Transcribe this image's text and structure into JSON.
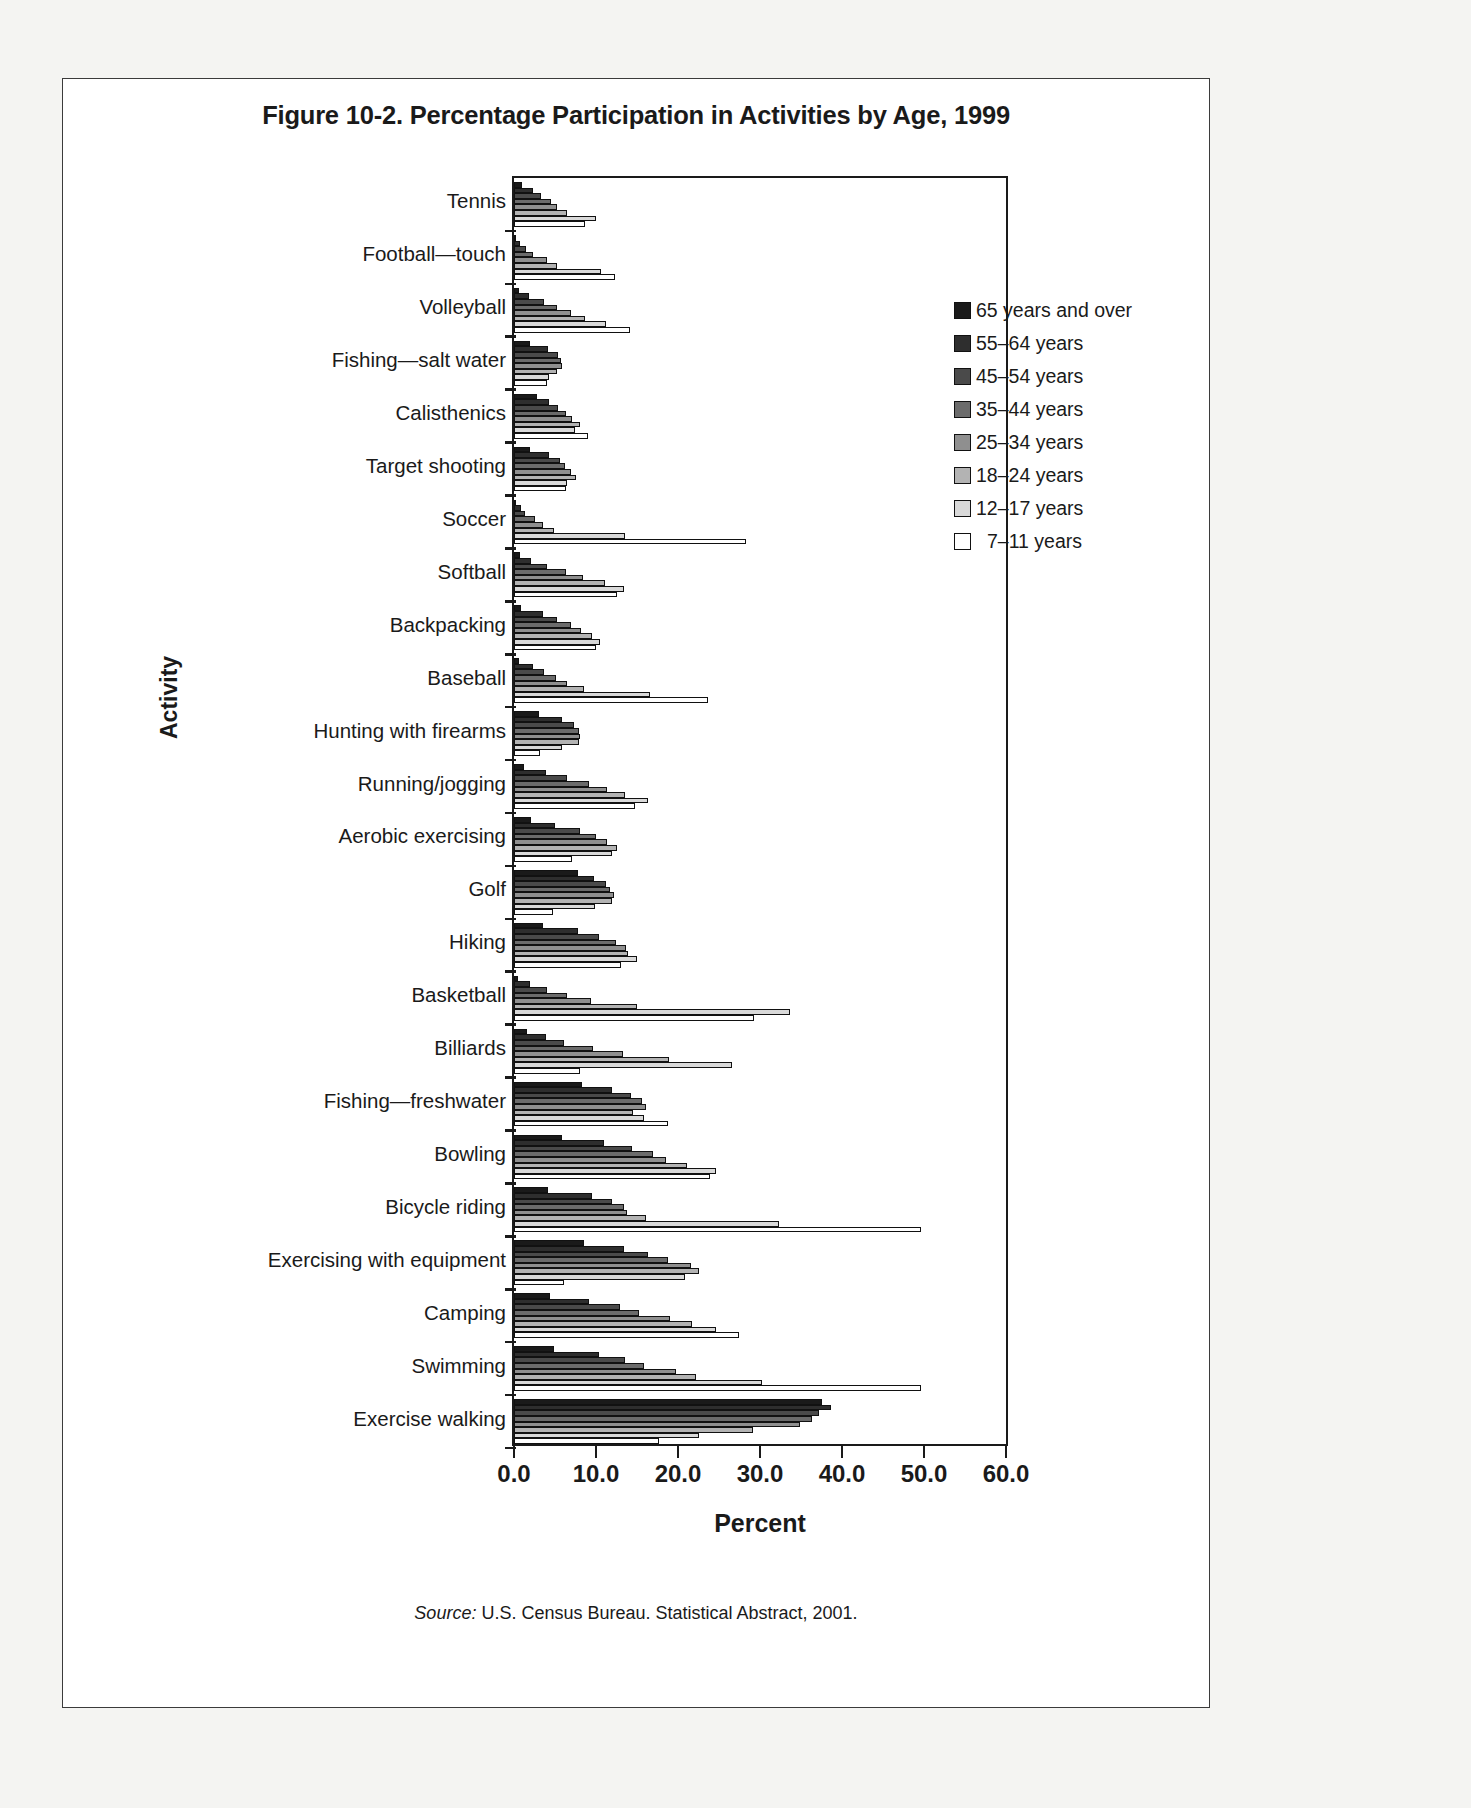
{
  "figure": {
    "title": "Figure 10-2. Percentage Participation in Activities by Age, 1999",
    "source": "U.S. Census Bureau. Statistical Abstract, 2001.",
    "source_prefix": "Source:"
  },
  "chart_data": {
    "type": "bar",
    "orientation": "horizontal",
    "title": "Figure 10-2. Percentage Participation in Activities by Age, 1999",
    "xlabel": "Percent",
    "ylabel": "Activity",
    "xlim": [
      0.0,
      60.0
    ],
    "xticks": [
      "0.0",
      "10.0",
      "20.0",
      "30.0",
      "40.0",
      "50.0",
      "60.0"
    ],
    "grid": false,
    "legend_position": "top-right inside plot",
    "categories": [
      "Tennis",
      "Football—touch",
      "Volleyball",
      "Fishing—salt water",
      "Calisthenics",
      "Target shooting",
      "Soccer",
      "Softball",
      "Backpacking",
      "Baseball",
      "Hunting with firearms",
      "Running/jogging",
      "Aerobic exercising",
      "Golf",
      "Hiking",
      "Basketball",
      "Billiards",
      "Fishing—freshwater",
      "Bowling",
      "Bicycle riding",
      "Exercising with equipment",
      "Camping",
      "Swimming",
      "Exercise walking"
    ],
    "series": [
      {
        "name": "65 years and over",
        "color": "#1a1a1a",
        "values": [
          1.0,
          0.3,
          0.6,
          1.9,
          2.8,
          2.0,
          0.2,
          0.7,
          0.9,
          0.6,
          3.1,
          1.2,
          2.1,
          7.8,
          3.5,
          0.5,
          1.6,
          8.3,
          5.9,
          4.1,
          8.5,
          4.4,
          4.9,
          37.6
        ]
      },
      {
        "name": "55–64 years",
        "color": "#2e2e2e",
        "values": [
          2.3,
          0.7,
          1.8,
          4.2,
          4.3,
          4.3,
          0.8,
          2.1,
          3.5,
          2.3,
          5.8,
          3.9,
          5.0,
          9.8,
          7.8,
          2.0,
          3.9,
          11.9,
          11.0,
          9.5,
          13.4,
          9.1,
          10.4,
          38.6
        ]
      },
      {
        "name": "45–54 years",
        "color": "#4a4a4a",
        "values": [
          3.3,
          1.5,
          3.6,
          5.4,
          5.4,
          5.6,
          1.3,
          4.0,
          5.3,
          3.6,
          7.3,
          6.5,
          8.0,
          11.2,
          10.4,
          4.0,
          6.1,
          14.3,
          14.4,
          11.9,
          16.4,
          12.9,
          13.5,
          37.2
        ]
      },
      {
        "name": "35–44 years",
        "color": "#6b6b6b",
        "values": [
          4.5,
          2.3,
          5.2,
          5.7,
          6.4,
          6.2,
          2.5,
          6.3,
          7.0,
          5.1,
          7.9,
          9.1,
          10.0,
          11.7,
          12.4,
          6.5,
          9.6,
          15.6,
          17.0,
          13.4,
          18.8,
          15.3,
          15.8,
          36.4
        ]
      },
      {
        "name": "25–34 years",
        "color": "#8f8f8f",
        "values": [
          5.3,
          4.0,
          6.9,
          5.9,
          7.1,
          6.9,
          3.5,
          8.4,
          8.2,
          6.5,
          8.1,
          11.4,
          11.3,
          12.2,
          13.6,
          9.4,
          13.3,
          16.1,
          18.5,
          13.8,
          21.6,
          19.0,
          19.7,
          34.9
        ]
      },
      {
        "name": "18–24 years",
        "color": "#b3b3b3",
        "values": [
          6.5,
          5.2,
          8.6,
          5.2,
          8.0,
          7.5,
          4.9,
          11.1,
          9.5,
          8.5,
          7.9,
          13.5,
          12.6,
          11.9,
          13.9,
          15.0,
          18.9,
          14.5,
          21.1,
          16.1,
          22.6,
          21.7,
          22.2,
          29.1
        ]
      },
      {
        "name": "12–17 years",
        "color": "#d9d9d9",
        "values": [
          10.0,
          10.6,
          11.2,
          4.3,
          7.4,
          6.5,
          13.5,
          13.4,
          10.5,
          16.6,
          5.9,
          16.3,
          11.9,
          9.9,
          15.0,
          33.6,
          26.6,
          15.9,
          24.6,
          32.3,
          20.9,
          24.6,
          30.3,
          22.5
        ]
      },
      {
        "name": "7–11 years",
        "color": "#ffffff",
        "values": [
          8.7,
          12.3,
          14.2,
          4.0,
          9.0,
          6.4,
          28.3,
          12.5,
          10.0,
          23.7,
          3.2,
          14.8,
          7.1,
          4.8,
          13.1,
          29.3,
          8.1,
          18.8,
          23.9,
          49.6,
          6.1,
          27.4,
          49.6,
          17.7
        ]
      }
    ]
  }
}
